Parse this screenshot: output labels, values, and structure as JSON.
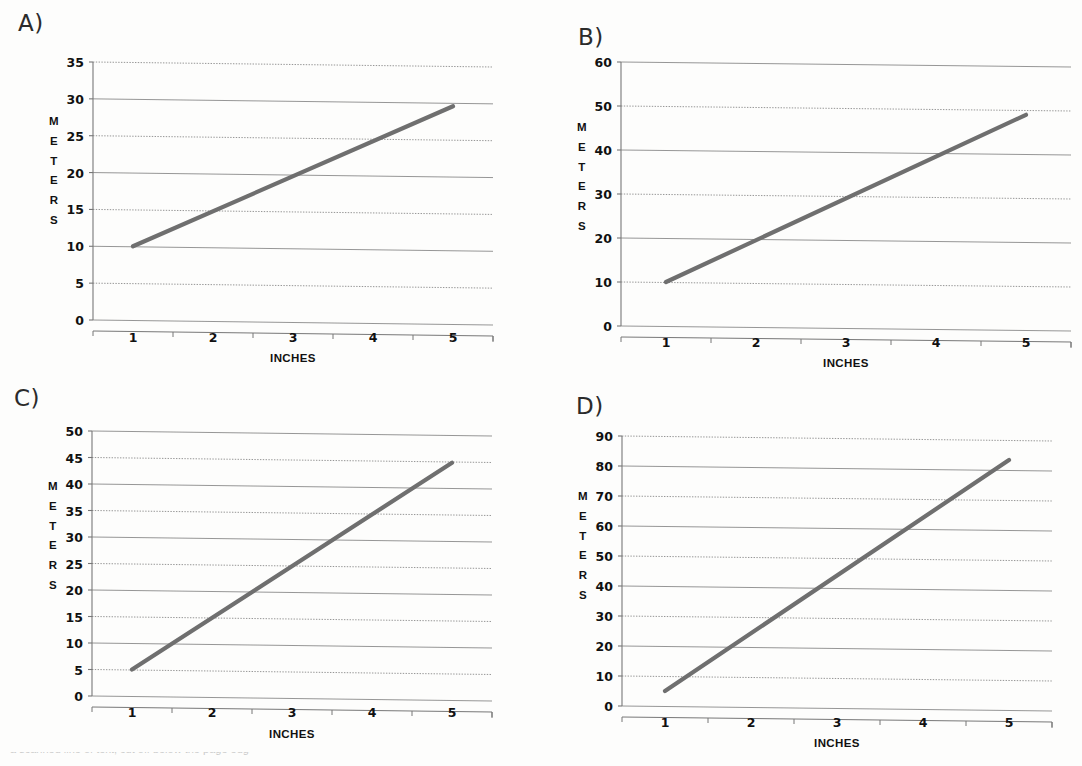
{
  "document": {
    "background_color": "#fdfdfc",
    "line_color": "#6f6f6f",
    "grid_color": "#8a8a8a",
    "axis_color": "#777777",
    "text_color": "#111111",
    "bottom_cut_text": "a scanned line of text, cut off below the page edge"
  },
  "panels": [
    {
      "letter": "A)",
      "chart_data": {
        "type": "line",
        "title": "",
        "xlabel": "INCHES",
        "ylabel": "METERS",
        "ylabel_letters": [
          "M",
          "E",
          "T",
          "E",
          "R",
          "S"
        ],
        "x": [
          1,
          5
        ],
        "values": [
          10,
          29
        ],
        "series": [
          {
            "name": "meters-per-inch",
            "x": [
              1,
              5
            ],
            "values": [
              10,
              29
            ]
          }
        ],
        "xlim": [
          0.5,
          5.5
        ],
        "ylim": [
          0,
          35
        ],
        "xticks": [
          1,
          2,
          3,
          4,
          5
        ],
        "xtick_labels": [
          "1",
          "2",
          "3",
          "4",
          "5"
        ],
        "yticks": [
          0,
          5,
          10,
          15,
          20,
          25,
          30,
          35
        ],
        "ytick_labels": [
          "35",
          "30",
          "25",
          "20",
          "15",
          "10",
          "5",
          "0"
        ],
        "grid": true,
        "legend": "none",
        "slope": 4.75,
        "intercept": 5.25
      }
    },
    {
      "letter": "B)",
      "chart_data": {
        "type": "line",
        "title": "",
        "xlabel": "INCHES",
        "ylabel": "METERS",
        "ylabel_letters": [
          "M",
          "E",
          "T",
          "E",
          "R",
          "S"
        ],
        "x": [
          1,
          5
        ],
        "values": [
          10,
          48
        ],
        "series": [
          {
            "name": "meters-per-inch",
            "x": [
              1,
              5
            ],
            "values": [
              10,
              48
            ]
          }
        ],
        "xlim": [
          0.5,
          5.5
        ],
        "ylim": [
          0,
          60
        ],
        "xticks": [
          1,
          2,
          3,
          4,
          5
        ],
        "xtick_labels": [
          "1",
          "2",
          "3",
          "4",
          "5"
        ],
        "yticks": [
          0,
          10,
          20,
          30,
          40,
          50,
          60
        ],
        "ytick_labels": [
          "60",
          "50",
          "40",
          "30",
          "20",
          "10",
          "0"
        ],
        "grid": true,
        "legend": "none",
        "slope": 9.5,
        "intercept": 0.5
      }
    },
    {
      "letter": "C)",
      "chart_data": {
        "type": "line",
        "title": "",
        "xlabel": "INCHES",
        "ylabel": "METERS",
        "ylabel_letters": [
          "M",
          "E",
          "T",
          "E",
          "R",
          "S"
        ],
        "x": [
          1,
          5
        ],
        "values": [
          5,
          44
        ],
        "series": [
          {
            "name": "meters-per-inch",
            "x": [
              1,
              5
            ],
            "values": [
              5,
              44
            ]
          }
        ],
        "xlim": [
          0.5,
          5.5
        ],
        "ylim": [
          0,
          50
        ],
        "xticks": [
          1,
          2,
          3,
          4,
          5
        ],
        "xtick_labels": [
          "1",
          "2",
          "3",
          "4",
          "5"
        ],
        "yticks": [
          0,
          5,
          10,
          15,
          20,
          25,
          30,
          35,
          40,
          45,
          50
        ],
        "ytick_labels": [
          "50",
          "45",
          "40",
          "35",
          "30",
          "25",
          "20",
          "15",
          "10",
          "5",
          "0"
        ],
        "grid": true,
        "legend": "none",
        "slope": 9.75,
        "intercept": -4.75
      }
    },
    {
      "letter": "D)",
      "chart_data": {
        "type": "line",
        "title": "",
        "xlabel": "INCHES",
        "ylabel": "METERS",
        "ylabel_letters": [
          "M",
          "E",
          "T",
          "E",
          "R",
          "S"
        ],
        "x": [
          1,
          5
        ],
        "values": [
          5,
          82
        ],
        "series": [
          {
            "name": "meters-per-inch",
            "x": [
              1,
              5
            ],
            "values": [
              5,
              82
            ]
          }
        ],
        "xlim": [
          0.5,
          5.5
        ],
        "ylim": [
          0,
          90
        ],
        "xticks": [
          1,
          2,
          3,
          4,
          5
        ],
        "xtick_labels": [
          "1",
          "2",
          "3",
          "4",
          "5"
        ],
        "yticks": [
          0,
          10,
          20,
          30,
          40,
          50,
          60,
          70,
          80,
          90
        ],
        "ytick_labels": [
          "90",
          "80",
          "70",
          "60",
          "50",
          "40",
          "30",
          "20",
          "10",
          "0"
        ],
        "grid": true,
        "legend": "none",
        "slope": 19.25,
        "intercept": -14.25
      }
    }
  ]
}
